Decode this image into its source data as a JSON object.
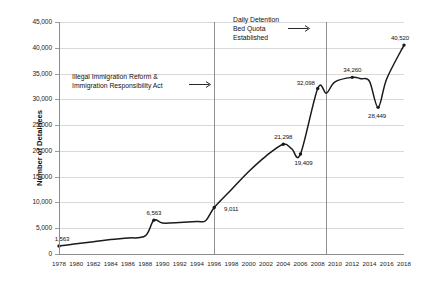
{
  "chart_data": {
    "type": "line",
    "title": "",
    "xlabel": "",
    "ylabel": "Number of Detainees",
    "xlim": [
      1978,
      2018
    ],
    "ylim": [
      0,
      45000
    ],
    "grid": true,
    "legend": "none",
    "x_ticks": [
      "1978",
      "1980",
      "1982",
      "1984",
      "1986",
      "1988",
      "1990",
      "1992",
      "1994",
      "1996",
      "1998",
      "2000",
      "2002",
      "2004",
      "2006",
      "2008",
      "2010",
      "2012",
      "2014",
      "2016",
      "2018"
    ],
    "y_ticks": [
      "0",
      "5,000",
      "10,000",
      "15,000",
      "20,000",
      "25,000",
      "30,000",
      "35,000",
      "40,000",
      "45,000"
    ],
    "series": [
      {
        "name": "Average Daily Population in Immigration Detention",
        "color": "#1a1a1a",
        "x": [
          1978,
          1980,
          1982,
          1984,
          1986,
          1988,
          1989,
          1990,
          1992,
          1994,
          1995,
          1996,
          1998,
          2000,
          2002,
          2004,
          2005,
          2006,
          2008,
          2009,
          2010,
          2012,
          2013,
          2014,
          2015,
          2016,
          2018
        ],
        "values": [
          1563,
          2000,
          2370,
          2800,
          3100,
          3500,
          6563,
          6000,
          6100,
          6300,
          6450,
          9011,
          12500,
          16000,
          19000,
          21298,
          20400,
          19409,
          32098,
          31200,
          33400,
          34260,
          34000,
          33500,
          28449,
          34000,
          40520
        ]
      }
    ],
    "point_labels": [
      {
        "label": "1,563",
        "x": 1978,
        "y": 1563
      },
      {
        "label": "6,563",
        "x": 1989,
        "y": 6563
      },
      {
        "label": "9,011",
        "x": 1996,
        "y": 9011
      },
      {
        "label": "21,298",
        "x": 2004,
        "y": 21298
      },
      {
        "label": "19,409",
        "x": 2006,
        "y": 19409
      },
      {
        "label": "32,098",
        "x": 2008,
        "y": 32098
      },
      {
        "label": "34,260",
        "x": 2012,
        "y": 34260
      },
      {
        "label": "28,449",
        "x": 2015,
        "y": 28449
      },
      {
        "label": "40,520",
        "x": 2018,
        "y": 40520
      }
    ],
    "reference_lines": [
      {
        "name": "illegal-immigration-reform-act",
        "x": 1996
      },
      {
        "name": "daily-detention-bed-quota",
        "x": 2009
      }
    ],
    "annotations": [
      {
        "name": "illegal-immigration-reform-act",
        "lines": [
          "Illegal Immigration Reform &",
          "Immigration Responsibility Act"
        ],
        "arrow": "right-arrow"
      },
      {
        "name": "daily-detention-bed-quota",
        "lines": [
          "Daily Detention",
          "Bed Quota",
          "Established"
        ],
        "arrow": "right-arrow"
      }
    ]
  }
}
